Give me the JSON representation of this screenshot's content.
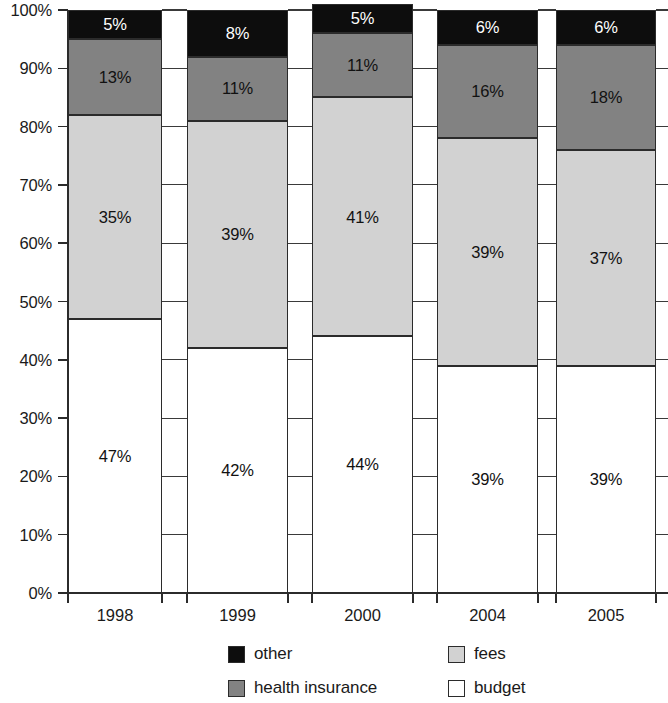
{
  "chart_data": {
    "type": "bar",
    "stacked": true,
    "stack_mode": "percent",
    "title": "",
    "subtitle": "",
    "xlabel": "",
    "ylabel": "",
    "categories": [
      "1998",
      "1999",
      "2000",
      "2004",
      "2005"
    ],
    "ylim": [
      0,
      100
    ],
    "ytick_labels": [
      "0%",
      "10%",
      "20%",
      "30%",
      "40%",
      "50%",
      "60%",
      "70%",
      "80%",
      "90%",
      "100%"
    ],
    "ytick_values": [
      0,
      10,
      20,
      30,
      40,
      50,
      60,
      70,
      80,
      90,
      100
    ],
    "grid": false,
    "legend_position": "bottom",
    "series": [
      {
        "name": "budget",
        "color": "#ffffff",
        "values": [
          47,
          42,
          44,
          39,
          39
        ],
        "labels": [
          "47%",
          "42%",
          "44%",
          "39%",
          "39%"
        ]
      },
      {
        "name": "fees",
        "color": "#d2d2d2",
        "values": [
          35,
          39,
          41,
          39,
          37
        ],
        "labels": [
          "35%",
          "39%",
          "41%",
          "39%",
          "37%"
        ]
      },
      {
        "name": "health insurance",
        "color": "#828282",
        "values": [
          13,
          11,
          11,
          16,
          18
        ],
        "labels": [
          "13%",
          "11%",
          "11%",
          "16%",
          "18%"
        ]
      },
      {
        "name": "other",
        "color": "#0d0d0d",
        "values": [
          5,
          8,
          5,
          6,
          6
        ],
        "labels": [
          "5%",
          "8%",
          "5%",
          "6%",
          "6%"
        ]
      }
    ]
  },
  "legend": {
    "entries": [
      {
        "label": "other",
        "swatch": "other",
        "swatch_icon": "legend-swatch-black"
      },
      {
        "label": "fees",
        "swatch": "fees",
        "swatch_icon": "legend-swatch-light-gray"
      },
      {
        "label": "health insurance",
        "swatch": "health",
        "swatch_icon": "legend-swatch-dark-gray"
      },
      {
        "label": "budget",
        "swatch": "budget",
        "swatch_icon": "legend-swatch-white"
      }
    ]
  }
}
